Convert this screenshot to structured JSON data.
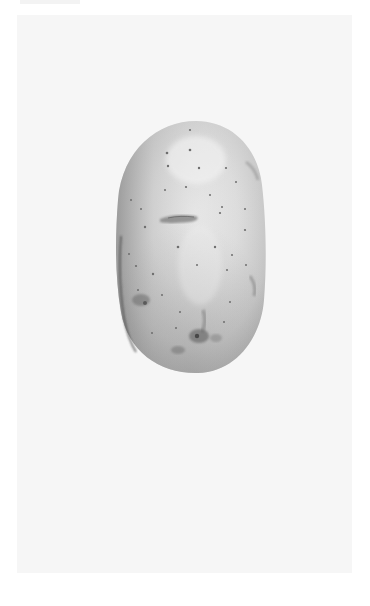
{
  "image": {
    "subject": "potato",
    "description": "Single whole potato, grayscale, photographed on a white background",
    "colors": {
      "page_background": "#ffffff",
      "photo_background": "#f6f6f6",
      "potato_light": "#e9e9e9",
      "potato_mid": "#c8c8c8",
      "potato_shadow": "#9a9a9a",
      "blemish": "#5a5a5a",
      "eye_dot": "#6e6e6e"
    }
  }
}
